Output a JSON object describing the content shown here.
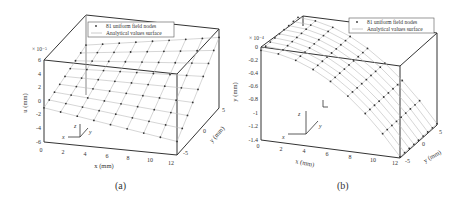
{
  "chart_data": [
    {
      "id": "a",
      "type": "scatter3d-surface",
      "caption": "(a)",
      "legend": [
        "81 uniform field nodes",
        "Analytical values surface"
      ],
      "zlabel": "u (mm)",
      "zscale": "× 10⁻⁵",
      "zticks": [
        "6",
        "4",
        "2",
        "0",
        "-2",
        "-4",
        "-6"
      ],
      "zlim": [
        -6e-05,
        6e-05
      ],
      "xlabel": "x (mm)",
      "xticks": [
        "0",
        "2",
        "4",
        "6",
        "8",
        "10",
        "12"
      ],
      "xlim": [
        0,
        12
      ],
      "ylabel": "y (mm)",
      "yticks": [
        "-5",
        "0",
        "5"
      ],
      "ylim": [
        -6,
        6
      ],
      "grid": "9x9 nodes",
      "axes_glyph": {
        "x": "x",
        "y": "y",
        "z": "z"
      }
    },
    {
      "id": "b",
      "type": "scatter3d-surface",
      "caption": "(b)",
      "legend": [
        "81 uniform field nodes",
        "Analytical values surface"
      ],
      "zlabel": "y (mm)",
      "zscale": "× 10⁻⁴",
      "zticks": [
        "0",
        "-0.2",
        "-0.4",
        "-0.6",
        "-0.8",
        "-1",
        "-1.2",
        "-1.4"
      ],
      "zlim": [
        -0.00014,
        0
      ],
      "xlabel": "x (mm)",
      "xticks": [
        "0",
        "2",
        "4",
        "6",
        "8",
        "10",
        "12"
      ],
      "xlim": [
        0,
        12
      ],
      "ylabel": "y (mm)",
      "yticks": [
        "-5",
        "0",
        "5"
      ],
      "ylim": [
        -6,
        6
      ],
      "grid": "9x9 nodes",
      "axes_glyph": {
        "x": "x",
        "y": "y",
        "z": "z"
      }
    }
  ]
}
